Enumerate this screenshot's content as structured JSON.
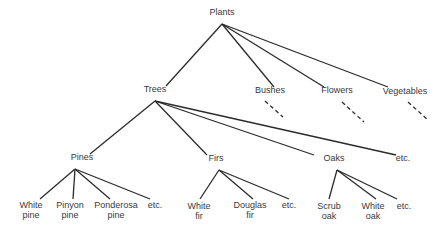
{
  "diagram": {
    "type": "tree",
    "nodes": [
      {
        "id": "plants",
        "label": "Plants",
        "x": 222,
        "y": 12
      },
      {
        "id": "trees",
        "label": "Trees",
        "x": 155,
        "y": 89
      },
      {
        "id": "bushes",
        "label": "Bushes",
        "x": 270,
        "y": 90
      },
      {
        "id": "flowers",
        "label": "Flowers",
        "x": 337,
        "y": 90
      },
      {
        "id": "vegetables",
        "label": "Vegetables",
        "x": 405,
        "y": 91
      },
      {
        "id": "pines",
        "label": "Pines",
        "x": 82,
        "y": 157
      },
      {
        "id": "firs",
        "label": "Firs",
        "x": 216,
        "y": 158
      },
      {
        "id": "oaks",
        "label": "Oaks",
        "x": 334,
        "y": 158
      },
      {
        "id": "trees-etc",
        "label": "etc.",
        "x": 403,
        "y": 158
      },
      {
        "id": "white-pine",
        "label": "White\npine",
        "x": 31,
        "y": 205
      },
      {
        "id": "pinyon-pine",
        "label": "Pinyon\npine",
        "x": 70,
        "y": 205
      },
      {
        "id": "ponderosa-pine",
        "label": "Ponderosa\npine",
        "x": 116,
        "y": 205
      },
      {
        "id": "pines-etc",
        "label": "etc.",
        "x": 155,
        "y": 205
      },
      {
        "id": "white-fir",
        "label": "White\nfir",
        "x": 199,
        "y": 206
      },
      {
        "id": "douglas-fir",
        "label": "Douglas\nfir",
        "x": 250,
        "y": 205
      },
      {
        "id": "firs-etc",
        "label": "etc.",
        "x": 289,
        "y": 205
      },
      {
        "id": "scrub-oak",
        "label": "Scrub\noak",
        "x": 329,
        "y": 206
      },
      {
        "id": "white-oak",
        "label": "White\noak",
        "x": 373,
        "y": 206
      },
      {
        "id": "oaks-etc",
        "label": "etc.",
        "x": 404,
        "y": 206
      }
    ],
    "edges": [
      {
        "from": [
          222,
          24
        ],
        "to": [
          166,
          86
        ]
      },
      {
        "from": [
          222,
          24
        ],
        "to": [
          274,
          87
        ]
      },
      {
        "from": [
          222,
          24
        ],
        "to": [
          324,
          87
        ]
      },
      {
        "from": [
          222,
          24
        ],
        "to": [
          388,
          87
        ]
      },
      {
        "from": [
          155,
          101
        ],
        "to": [
          90,
          154
        ]
      },
      {
        "from": [
          155,
          101
        ],
        "to": [
          207,
          155
        ]
      },
      {
        "from": [
          155,
          101
        ],
        "to": [
          314,
          155
        ]
      },
      {
        "from": [
          155,
          101
        ],
        "to": [
          396,
          155
        ]
      },
      {
        "from": [
          75,
          169
        ],
        "to": [
          40,
          199
        ]
      },
      {
        "from": [
          75,
          169
        ],
        "to": [
          73,
          199
        ]
      },
      {
        "from": [
          75,
          169
        ],
        "to": [
          110,
          199
        ]
      },
      {
        "from": [
          75,
          169
        ],
        "to": [
          150,
          199
        ]
      },
      {
        "from": [
          219,
          170
        ],
        "to": [
          200,
          199
        ]
      },
      {
        "from": [
          219,
          170
        ],
        "to": [
          253,
          199
        ]
      },
      {
        "from": [
          219,
          170
        ],
        "to": [
          289,
          199
        ]
      },
      {
        "from": [
          337,
          170
        ],
        "to": [
          329,
          199
        ]
      },
      {
        "from": [
          337,
          170
        ],
        "to": [
          376,
          199
        ]
      },
      {
        "from": [
          337,
          170
        ],
        "to": [
          397,
          199
        ]
      }
    ],
    "dashed_edges": [
      {
        "from": [
          265,
          101
        ],
        "to": [
          283,
          117
        ]
      },
      {
        "from": [
          342,
          102
        ],
        "to": [
          364,
          122
        ]
      },
      {
        "from": [
          408,
          102
        ],
        "to": [
          428,
          120
        ]
      }
    ]
  }
}
